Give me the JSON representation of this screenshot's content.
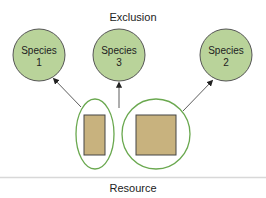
{
  "title": "Exclusion",
  "footer": "Resource",
  "species": [
    {
      "line1": "Species",
      "line2": "1"
    },
    {
      "line1": "Species",
      "line2": "3"
    },
    {
      "line1": "Species",
      "line2": "2"
    }
  ],
  "colors": {
    "species_fill": "#b9d39a",
    "species_stroke": "#555555",
    "ellipse_stroke": "#6aa84f",
    "resource_fill": "#c8b27e",
    "resource_stroke": "#444444",
    "divider": "#d8d8d8"
  }
}
